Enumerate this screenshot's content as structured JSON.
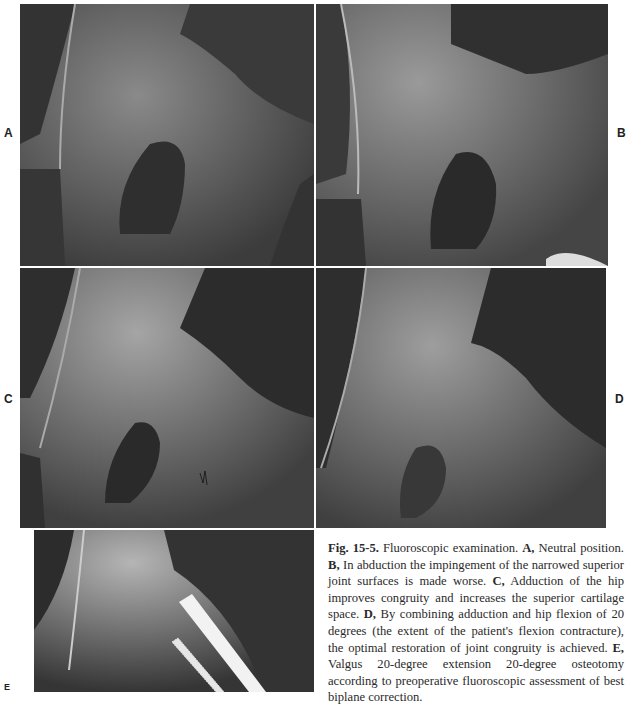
{
  "figure": {
    "panels": [
      {
        "id": "A",
        "label": "A"
      },
      {
        "id": "B",
        "label": "B"
      },
      {
        "id": "C",
        "label": "C"
      },
      {
        "id": "D",
        "label": "D"
      },
      {
        "id": "E",
        "label": "E"
      }
    ],
    "caption": {
      "fig_number": "Fig. 15-5.",
      "intro": " Fluoroscopic examination. ",
      "a_label": "A,",
      "a_text": " Neutral position. ",
      "b_label": "B,",
      "b_text": " In abduction the impingement of the narrowed superior joint surfaces is made worse. ",
      "c_label": "C,",
      "c_text": " Adduction of the hip improves congruity and increases the superior cartilage space. ",
      "d_label": "D,",
      "d_text": " By combining adduction and hip flexion of 20 degrees (the extent of the patient's flexion contracture), the optimal restoration of joint congruity is achieved. ",
      "e_label": "E,",
      "e_text": " Valgus 20-degree extension 20-degree osteotomy according to preoperative fluoroscopic assessment of best biplane correction."
    }
  }
}
